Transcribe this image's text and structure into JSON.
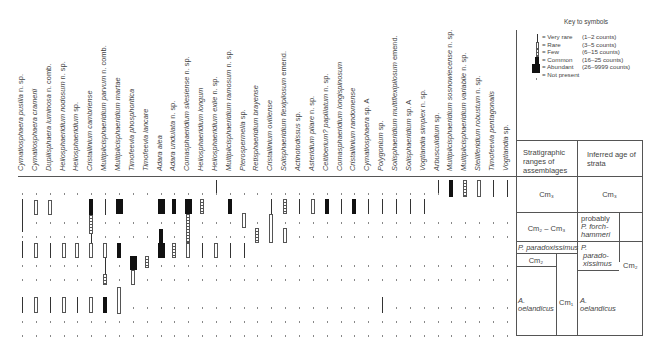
{
  "chart_data": {
    "type": "range_chart",
    "species": [
      "Cymatiosphaera pusilla n. sp.",
      "Cymatiosphaera cramerii",
      "Dupliisphaera luminosa n. comb.",
      "Heliosphaeridium nodosum n. sp.",
      "Heliosphaeridium sp.",
      "Cristallinium cambriense",
      "Multiplicisphaeridium parvum n. comb.",
      "Multiplicisphaeridium martae",
      "Timofeevia phosphoritica",
      "Timofeevia lancare",
      "Adara alea",
      "Adara undulata n. sp.",
      "Comasphaeridium silesiense n. sp.",
      "Heliosphaeridium longum",
      "Heliosphaeridium exile n. sp.",
      "Multiplicisphaeridium ramosum n. sp.",
      "Pterospermella sp.",
      "Retisphaeridium brayense",
      "Cristallinium ovillense",
      "Solisphaeridium flexipilosum emend.",
      "Actinotodissus sp.",
      "Asteridium pilare n. sp.",
      "Celtiberium? papillatum n. sp.",
      "Comasphaeridium longispinosum",
      "Cristallinium randomense",
      "Cymatiosphaera sp. A",
      "Polygonium sp.",
      "Solisphaeridium multiflexipilosum emend.",
      "Solisphaeridium sp. A",
      "Vogtlandia simplex n. sp.",
      "Arbusculidium sp.",
      "Multiplicisphaeridium sosnowiecense n. sp.",
      "Multiplicisphaeridium variabile n. sp.",
      "Stelliferidium robustum n. sp.",
      "Timofeevia pentagonalis",
      "Vogtlandia sp."
    ],
    "italic_parts": [
      "Cymatiosphaera pusilla",
      "Cymatiosphaera cramerii",
      "Dupliisphaera luminosa",
      "Heliosphaeridium nodosum",
      "Heliosphaeridium",
      "Cristallinium cambriense",
      "Multiplicisphaeridium parvum",
      "Multiplicisphaeridium martae",
      "Timofeevia phosphoritica",
      "Timofeevia lancare",
      "Adara alea",
      "Adara undulata",
      "Comasphaeridium silesiense",
      "Heliosphaeridium longum",
      "Heliosphaeridium exile",
      "Multiplicisphaeridium ramosum",
      "Pterospermella",
      "Retisphaeridium brayense",
      "Cristallinium ovillense",
      "Solisphaeridium flexipilosum",
      "Actinotodissus",
      "Asteridium pilare",
      "Celtiberium? papillatum",
      "Comasphaeridium longispinosum",
      "Cristallinium randomense",
      "Cymatiosphaera",
      "Polygonium",
      "Solisphaeridium multiflexipilosum",
      "Solisphaeridium",
      "Vogtlandia simplex",
      "Arbusculidium",
      "Multiplicisphaeridium sosnowiecense",
      "Multiplicisphaeridium variabile",
      "Stelliferidium robustum",
      "Timofeevia pentagonalis",
      "Vogtlandia"
    ],
    "sample_rows_y": [
      193,
      207,
      222,
      236,
      250,
      265,
      279,
      293,
      307,
      321,
      335
    ],
    "ranges": [
      [
        {
          "type": "very_rare",
          "y1": 199,
          "y2": 232
        },
        {
          "type": "very_rare",
          "y1": 241,
          "y2": 258
        },
        {
          "type": "very_rare",
          "y1": 297,
          "y2": 313
        }
      ],
      [
        {
          "type": "rare",
          "y1": 200,
          "y2": 215
        },
        {
          "type": "rare",
          "y1": 243,
          "y2": 258
        },
        {
          "type": "rare",
          "y1": 297,
          "y2": 313
        }
      ],
      [
        {
          "type": "rare",
          "y1": 200,
          "y2": 215
        },
        {
          "type": "very_rare",
          "y1": 243,
          "y2": 258
        },
        {
          "type": "very_rare",
          "y1": 297,
          "y2": 313
        }
      ],
      [
        {
          "type": "rare",
          "y1": 243,
          "y2": 258
        },
        {
          "type": "rare",
          "y1": 297,
          "y2": 313
        }
      ],
      [
        {
          "type": "rare",
          "y1": 243,
          "y2": 258
        },
        {
          "type": "very_rare",
          "y1": 297,
          "y2": 313
        }
      ],
      [
        {
          "type": "common",
          "y1": 199,
          "y2": 215
        },
        {
          "type": "few",
          "y1": 215,
          "y2": 234
        },
        {
          "type": "very_rare",
          "y1": 234,
          "y2": 243
        },
        {
          "type": "rare",
          "y1": 243,
          "y2": 258
        },
        {
          "type": "rare",
          "y1": 297,
          "y2": 313
        }
      ],
      [
        {
          "type": "very_rare",
          "y1": 199,
          "y2": 215
        },
        {
          "type": "rare",
          "y1": 243,
          "y2": 258
        },
        {
          "type": "very_rare",
          "y1": 258,
          "y2": 274
        },
        {
          "type": "few",
          "y1": 274,
          "y2": 285
        },
        {
          "type": "common",
          "y1": 297,
          "y2": 313
        }
      ],
      [
        {
          "type": "abundant",
          "y1": 199,
          "y2": 214
        },
        {
          "type": "common",
          "y1": 243,
          "y2": 258
        },
        {
          "type": "rare",
          "y1": 287,
          "y2": 314
        }
      ],
      [
        {
          "type": "abundant",
          "y1": 256,
          "y2": 270
        },
        {
          "type": "rare",
          "y1": 270,
          "y2": 285
        }
      ],
      [
        {
          "type": "few",
          "y1": 256,
          "y2": 268
        }
      ],
      [
        {
          "type": "abundant",
          "y1": 199,
          "y2": 214
        },
        {
          "type": "common",
          "y1": 229,
          "y2": 243
        },
        {
          "type": "abundant",
          "y1": 243,
          "y2": 258
        }
      ],
      [
        {
          "type": "common",
          "y1": 199,
          "y2": 214
        },
        {
          "type": "few",
          "y1": 243,
          "y2": 258
        }
      ],
      [
        {
          "type": "abundant",
          "y1": 199,
          "y2": 214
        },
        {
          "type": "few",
          "y1": 214,
          "y2": 243
        },
        {
          "type": "rare",
          "y1": 243,
          "y2": 258
        }
      ],
      [
        {
          "type": "few",
          "y1": 199,
          "y2": 214
        },
        {
          "type": "very_rare",
          "y1": 243,
          "y2": 258
        }
      ],
      [
        {
          "type": "very_rare",
          "y1": 180,
          "y2": 193
        },
        {
          "type": "rare",
          "y1": 243,
          "y2": 258
        }
      ],
      [
        {
          "type": "common",
          "y1": 199,
          "y2": 214
        },
        {
          "type": "very_rare",
          "y1": 243,
          "y2": 258
        }
      ],
      [
        {
          "type": "rare",
          "y1": 213,
          "y2": 228
        },
        {
          "type": "very_rare",
          "y1": 243,
          "y2": 258
        }
      ],
      [
        {
          "type": "few",
          "y1": 228,
          "y2": 243
        }
      ],
      [
        {
          "type": "very_rare",
          "y1": 199,
          "y2": 214
        },
        {
          "type": "rare",
          "y1": 214,
          "y2": 243
        }
      ],
      [
        {
          "type": "few",
          "y1": 199,
          "y2": 214
        },
        {
          "type": "rare",
          "y1": 228,
          "y2": 243
        }
      ],
      [
        {
          "type": "very_rare",
          "y1": 199,
          "y2": 214
        }
      ],
      [
        {
          "type": "rare",
          "y1": 199,
          "y2": 214
        }
      ],
      [
        {
          "type": "common",
          "y1": 199,
          "y2": 214
        }
      ],
      [
        {
          "type": "very_rare",
          "y1": 199,
          "y2": 214
        }
      ],
      [
        {
          "type": "common",
          "y1": 199,
          "y2": 214
        }
      ],
      [
        {
          "type": "very_rare",
          "y1": 199,
          "y2": 214
        }
      ],
      [
        {
          "type": "very_rare",
          "y1": 199,
          "y2": 214
        },
        {
          "type": "very_rare",
          "y1": 297,
          "y2": 313
        }
      ],
      [
        {
          "type": "very_rare",
          "y1": 199,
          "y2": 214
        }
      ],
      [
        {
          "type": "very_rare",
          "y1": 199,
          "y2": 214
        }
      ],
      [
        {
          "type": "very_rare",
          "y1": 199,
          "y2": 214
        }
      ],
      [
        {
          "type": "very_rare",
          "y1": 180,
          "y2": 193
        }
      ],
      [
        {
          "type": "common",
          "y1": 180,
          "y2": 197
        }
      ],
      [
        {
          "type": "few",
          "y1": 180,
          "y2": 197
        }
      ],
      [
        {
          "type": "rare",
          "y1": 180,
          "y2": 197
        }
      ],
      [
        {
          "type": "very_rare",
          "y1": 180,
          "y2": 197
        }
      ],
      [
        {
          "type": "very_rare",
          "y1": 180,
          "y2": 197
        }
      ]
    ],
    "legend": {
      "title": "Key to symbols",
      "entries": [
        {
          "symbol": "very_rare",
          "label": "= Very rare",
          "counts": "(1–2 counts)"
        },
        {
          "symbol": "rare",
          "label": "= Rare",
          "counts": "(3–5 counts)"
        },
        {
          "symbol": "few",
          "label": "= Few",
          "counts": "(6–15 counts)"
        },
        {
          "symbol": "common",
          "label": "= Common",
          "counts": "(16–25 counts)"
        },
        {
          "symbol": "abundant",
          "label": "= Abundant",
          "counts": "(26–9999 counts)"
        },
        {
          "symbol": "not_present",
          "label": "= Not present",
          "counts": ""
        }
      ]
    },
    "stratigraphy_table": {
      "header_left": "Stratigraphic ranges of assemblages",
      "header_right": "Inferred age of strata",
      "row1_left": "Cm₃",
      "row1_right": "Cm₃",
      "row2_left": "Cm₂ – Cm₃",
      "row2_right_1": "probably",
      "row2_right_2": "P. forch-",
      "row2_right_3": "hammeri",
      "row3_left_band": "P. paradoxissimus",
      "row3_left_sub": "Cm₂",
      "row3_right_1": "P.",
      "row3_right_2": "parado-",
      "row3_right_3": "xissimus",
      "side_right": "Cm₂",
      "row4_left_1": "A.",
      "row4_left_2": "oelandicus",
      "row4_left_side": "Cm₁",
      "row4_right_1": "A.",
      "row4_right_2": "oelandicus"
    }
  }
}
